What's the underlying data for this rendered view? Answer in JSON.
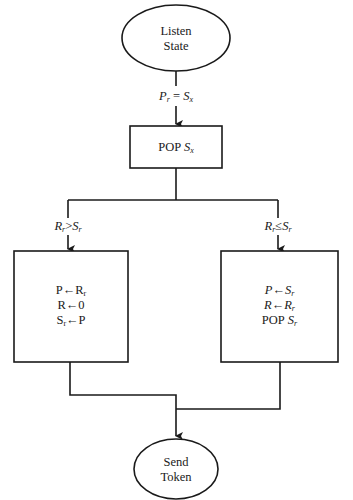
{
  "diagram": {
    "type": "flowchart",
    "nodes": {
      "start": {
        "shape": "ellipse",
        "lines": [
          "Listen",
          "State"
        ]
      },
      "pop_sx": {
        "shape": "rect",
        "label": "POP",
        "var": "S",
        "var_sub": "x"
      },
      "left_box": {
        "shape": "rect",
        "lines": [
          {
            "lhs": "P",
            "arrow": "←",
            "rhs": "R",
            "rhs_sub": "r"
          },
          {
            "lhs": "R",
            "arrow": "←",
            "rhs": "0",
            "rhs_sub": ""
          },
          {
            "lhs": "S",
            "lhs_sub": "r",
            "arrow": "←",
            "rhs": "P",
            "rhs_sub": ""
          }
        ]
      },
      "right_box": {
        "shape": "rect",
        "lines": [
          {
            "lhs": "P",
            "arrow": "←",
            "rhs": "S",
            "rhs_sub": "r"
          },
          {
            "lhs": "R",
            "arrow": "←",
            "rhs": "R",
            "rhs_sub": "r"
          },
          {
            "prefix": "POP",
            "rhs": "S",
            "rhs_sub": "r"
          }
        ]
      },
      "end": {
        "shape": "ellipse",
        "lines": [
          "Send",
          "Token"
        ]
      }
    },
    "edges": {
      "start_to_pop": {
        "condition": {
          "lhs": "P",
          "lhs_sub": "r",
          "op": "=",
          "rhs": "S",
          "rhs_sub": "x"
        }
      },
      "branch_left": {
        "condition": {
          "lhs": "R",
          "lhs_sub": "r",
          "op": ">",
          "rhs": "S",
          "rhs_sub": "r"
        }
      },
      "branch_right": {
        "condition": {
          "lhs": "R",
          "lhs_sub": "r",
          "op": "≤",
          "rhs": "S",
          "rhs_sub": "r"
        }
      }
    },
    "colors": {
      "stroke": "#1a1a1a",
      "background": "#ffffff"
    }
  }
}
